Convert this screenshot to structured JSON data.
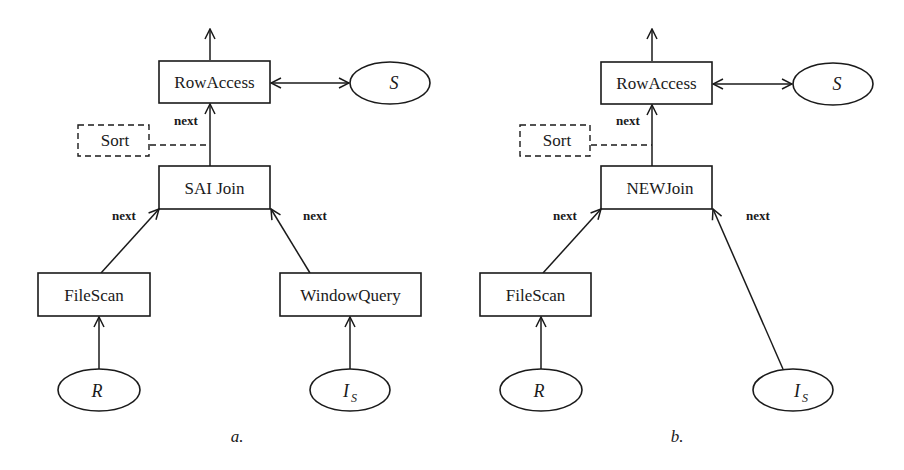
{
  "diagrams": [
    {
      "caption": "a.",
      "nodes": {
        "rowaccess": "RowAccess",
        "s": "S",
        "sort": "Sort",
        "join": "SAI Join",
        "filescan": "FileScan",
        "windowquery": "WindowQuery",
        "r": "R",
        "is_main": "I",
        "is_sub": "S"
      },
      "edges": {
        "join_to_rowaccess": "next",
        "filescan_to_join": "next",
        "windowquery_to_join": "next"
      }
    },
    {
      "caption": "b.",
      "nodes": {
        "rowaccess": "RowAccess",
        "s": "S",
        "sort": "Sort",
        "join": "NEWJoin",
        "filescan": "FileScan",
        "r": "R",
        "is_main": "I",
        "is_sub": "S"
      },
      "edges": {
        "join_to_rowaccess": "next",
        "filescan_to_join": "next",
        "is_to_join": "next"
      }
    }
  ]
}
